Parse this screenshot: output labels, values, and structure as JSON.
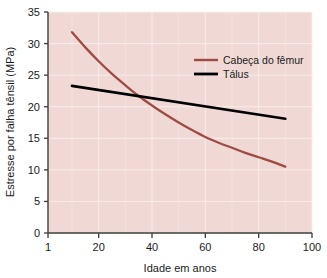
{
  "chart_data": {
    "type": "line",
    "title": "",
    "xlabel": "Idade em anos",
    "ylabel": "Estresse por falha tênsil (MPa)",
    "xlim": [
      1,
      100
    ],
    "ylim": [
      0,
      35
    ],
    "xticks": [
      "1",
      "20",
      "40",
      "60",
      "80",
      "100"
    ],
    "xtick_values": [
      1,
      20,
      40,
      60,
      80,
      100
    ],
    "yticks": [
      "0",
      "5",
      "10",
      "15",
      "20",
      "25",
      "30",
      "35"
    ],
    "ytick_values": [
      0,
      5,
      10,
      15,
      20,
      25,
      30,
      35
    ],
    "grid": true,
    "legend_position": "upper-right-inside",
    "plot_background": "#f0d9d5",
    "grid_color": "#faf0ee",
    "series": [
      {
        "name": "Cabeça do fêmur",
        "color": "#9e4b44",
        "x": [
          10,
          15,
          20,
          25,
          30,
          35,
          40,
          45,
          50,
          55,
          60,
          65,
          70,
          75,
          80,
          85,
          90
        ],
        "values": [
          31.8,
          29.4,
          27.2,
          25.2,
          23.4,
          21.7,
          20.2,
          18.8,
          17.5,
          16.3,
          15.2,
          14.3,
          13.5,
          12.7,
          12.0,
          11.3,
          10.5
        ]
      },
      {
        "name": "Tálus",
        "color": "#000000",
        "x": [
          10,
          90
        ],
        "values": [
          23.3,
          18.1
        ]
      }
    ],
    "annotations": []
  },
  "legend": {
    "items": [
      {
        "label": "Cabeça do fêmur",
        "color": "#9e4b44"
      },
      {
        "label": "Tálus",
        "color": "#000000"
      }
    ]
  }
}
